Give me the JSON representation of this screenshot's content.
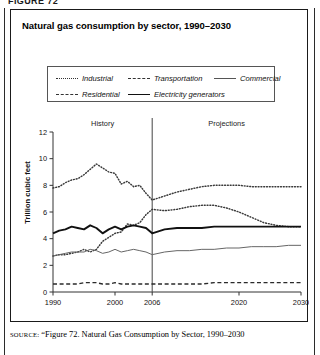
{
  "page": {
    "top_cut_text": "FIGURE 72",
    "source": {
      "label": "SOURCE:",
      "text": "“Figure 72. Natural Gas Consumption by Sector, 1990–2030"
    }
  },
  "figure": {
    "title": "Natural gas consumption by sector, 1990–2030"
  },
  "legend": {
    "entries": [
      {
        "label": "Industrial",
        "style": "dotted"
      },
      {
        "label": "Transportation",
        "style": "dashed"
      },
      {
        "label": "Commercial",
        "style": "thin-solid"
      },
      {
        "label": "Residential",
        "style": "dashed"
      },
      {
        "label": "Electricity generators",
        "style": "thick-solid"
      }
    ]
  },
  "chart_data": {
    "type": "line",
    "title": "Natural gas consumption by sector, 1990–2030",
    "xlabel": "",
    "ylabel": "Trillion cubic feet",
    "xlim": [
      1990,
      2030
    ],
    "ylim": [
      0,
      12
    ],
    "yticks": [
      0,
      2,
      4,
      6,
      8,
      10,
      12
    ],
    "xticks": [
      1990,
      2000,
      2006,
      2020,
      2030
    ],
    "grid": false,
    "legend_position": "top",
    "annotations": [
      {
        "text": "History",
        "x": 1998
      },
      {
        "text": "Projections",
        "x": 2018
      }
    ],
    "divider_x": 2006,
    "x": [
      1990,
      1991,
      1992,
      1993,
      1994,
      1995,
      1996,
      1997,
      1998,
      1999,
      2000,
      2001,
      2002,
      2003,
      2004,
      2005,
      2006,
      2008,
      2010,
      2012,
      2014,
      2016,
      2018,
      2020,
      2022,
      2024,
      2026,
      2028,
      2030
    ],
    "series": [
      {
        "name": "Industrial",
        "style": "dotted",
        "values": [
          7.8,
          7.9,
          8.2,
          8.4,
          8.5,
          8.8,
          9.2,
          9.6,
          9.3,
          9.0,
          8.9,
          8.1,
          8.3,
          7.9,
          8.0,
          7.4,
          6.9,
          7.2,
          7.5,
          7.7,
          7.9,
          8.0,
          8.0,
          8.0,
          7.9,
          7.9,
          7.9,
          7.9,
          7.9
        ]
      },
      {
        "name": "Electricity generators",
        "style": "dotted",
        "values": [
          2.7,
          2.8,
          2.8,
          2.9,
          3.0,
          3.2,
          3.0,
          3.2,
          3.8,
          4.1,
          4.4,
          4.5,
          5.1,
          5.0,
          5.2,
          5.8,
          6.2,
          6.1,
          6.2,
          6.4,
          6.5,
          6.5,
          6.3,
          6.0,
          5.6,
          5.2,
          5.0,
          4.9,
          4.9
        ]
      },
      {
        "name": "Residential",
        "style": "thick-solid",
        "values": [
          4.4,
          4.6,
          4.7,
          4.9,
          4.8,
          4.7,
          5.0,
          4.8,
          4.4,
          4.7,
          4.9,
          4.7,
          4.9,
          5.0,
          4.9,
          4.8,
          4.4,
          4.7,
          4.8,
          4.8,
          4.8,
          4.9,
          4.9,
          4.9,
          4.9,
          4.9,
          4.9,
          4.9,
          4.9
        ]
      },
      {
        "name": "Commercial",
        "style": "thin-solid",
        "values": [
          2.7,
          2.8,
          2.9,
          3.0,
          3.0,
          3.0,
          3.2,
          3.1,
          2.9,
          3.0,
          3.2,
          3.0,
          3.1,
          3.2,
          3.1,
          3.0,
          2.8,
          3.0,
          3.1,
          3.1,
          3.2,
          3.2,
          3.3,
          3.3,
          3.4,
          3.4,
          3.4,
          3.5,
          3.5
        ]
      },
      {
        "name": "Transportation",
        "style": "dashed",
        "values": [
          0.6,
          0.6,
          0.6,
          0.6,
          0.6,
          0.7,
          0.7,
          0.7,
          0.6,
          0.6,
          0.7,
          0.6,
          0.6,
          0.6,
          0.6,
          0.6,
          0.6,
          0.6,
          0.6,
          0.6,
          0.6,
          0.7,
          0.7,
          0.7,
          0.7,
          0.7,
          0.7,
          0.7,
          0.7
        ]
      }
    ]
  }
}
